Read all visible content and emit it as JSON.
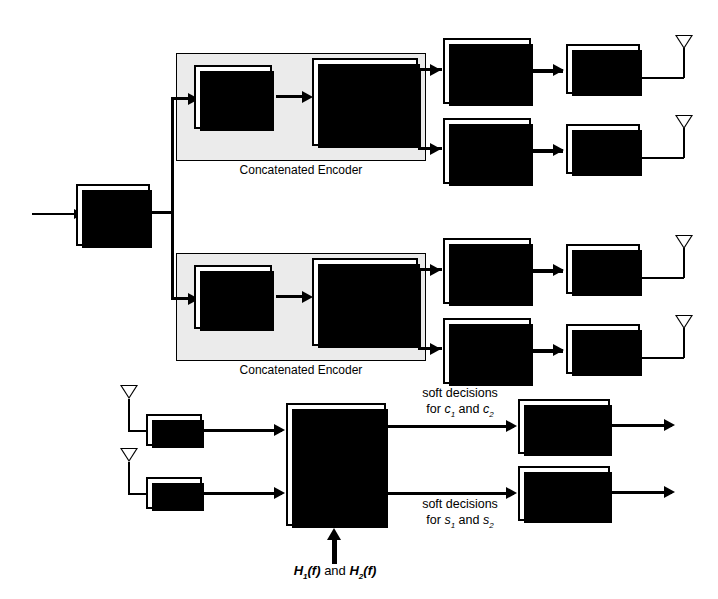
{
  "diagram": {
    "transmitter": {
      "serial_to_parallel": {
        "line1": "Serial",
        "line2": "to",
        "line3": "Parallel"
      },
      "branches": [
        {
          "group_label": "Concatenated Encoder",
          "channel_encoder": {
            "line1": "Channel",
            "line2": "Encoder",
            "line3": "R1"
          },
          "space_time_block_code": {
            "line1": "Space-Time",
            "line2": "Block Code"
          },
          "modulators": [
            "Modulator",
            "Modulator"
          ],
          "ifft": [
            "IFFT",
            "IFFT"
          ]
        },
        {
          "group_label": "Concatenated Encoder",
          "channel_encoder": {
            "line1": "Channel",
            "line2": "Encoder",
            "line3": "R2"
          },
          "space_time_block_code": {
            "line1": "Space-Time",
            "line2": "Block Code"
          },
          "modulators": [
            "Modulator",
            "Modulator"
          ],
          "ifft": [
            "IFFT",
            "IFFT"
          ]
        }
      ]
    },
    "receiver": {
      "fft": [
        "FFT",
        "FFT"
      ],
      "decoder": {
        "line1": "Interference",
        "line2": "Suppression",
        "line3": "and Space-Time",
        "line4": "Block Decoder"
      },
      "soft_decision_top": {
        "line1": "soft decisions",
        "line2_prefix": "for ",
        "sym1": "c",
        "sub1": "1",
        "conj": " and ",
        "sym2": "c",
        "sub2": "2"
      },
      "soft_decision_bottom": {
        "line1": "soft decisions",
        "line2_prefix": "for ",
        "sym1": "s",
        "sub1": "1",
        "conj": " and ",
        "sym2": "s",
        "sub2": "2"
      },
      "channel_decoders": [
        {
          "line1": "Channel",
          "line2": "Decoder R1"
        },
        {
          "line1": "Channel",
          "line2": "Decoder R2"
        }
      ],
      "channel_state": {
        "h1": "H",
        "h1sub": "1",
        "h1arg": "(f)",
        "conj": " and ",
        "h2": "H",
        "h2sub": "2",
        "h2arg": "(f)"
      }
    },
    "icons": {
      "tx_antenna": "antenna-icon",
      "rx_antenna": "antenna-icon",
      "constellation": "constellation-icon"
    },
    "colors": {
      "ink": "#000000",
      "paper": "#ffffff",
      "group_fill": "#ebebeb"
    }
  }
}
